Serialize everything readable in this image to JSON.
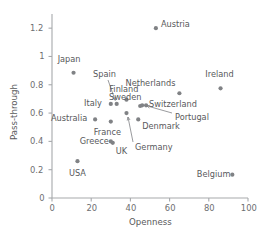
{
  "chart_data": {
    "type": "scatter",
    "title": "",
    "xlabel": "Openness",
    "ylabel": "Pass-through",
    "xlim": [
      0,
      100
    ],
    "ylim": [
      0,
      1.3
    ],
    "grid": false,
    "legend": "none",
    "xticks": [
      "0",
      "20",
      "40",
      "60",
      "80",
      "100"
    ],
    "xtick_values": [
      0,
      20,
      40,
      60,
      80,
      100
    ],
    "yticks": [
      "0",
      "0.2",
      "0.4",
      "0.6",
      "0.8",
      "1",
      "1.2"
    ],
    "ytick_values": [
      0,
      0.2,
      0.4,
      0.6,
      0.8,
      1.0,
      1.2
    ],
    "point_color": "#808285",
    "axis_color": "#a7a9ac",
    "points": [
      {
        "label": "Austria",
        "x": 53,
        "y": 1.2
      },
      {
        "label": "Japan",
        "x": 11,
        "y": 0.885
      },
      {
        "label": "Ireland",
        "x": 86,
        "y": 0.775
      },
      {
        "label": "Netherlands",
        "x": 65,
        "y": 0.74
      },
      {
        "label": "Finland",
        "x": 38,
        "y": 0.695
      },
      {
        "label": "Spain",
        "x": 33,
        "y": 0.665
      },
      {
        "label": "Italy",
        "x": 30,
        "y": 0.665
      },
      {
        "label": "Sweden",
        "x": 45,
        "y": 0.65
      },
      {
        "label": "Switzerland",
        "x": 48,
        "y": 0.655
      },
      {
        "label": "Portugal",
        "x": 46,
        "y": 0.655
      },
      {
        "label": "Germany",
        "x": 38,
        "y": 0.6
      },
      {
        "label": "Denmark",
        "x": 44,
        "y": 0.555
      },
      {
        "label": "Australia",
        "x": 22,
        "y": 0.555
      },
      {
        "label": "France",
        "x": 30,
        "y": 0.54
      },
      {
        "label": "Greece",
        "x": 30,
        "y": 0.4
      },
      {
        "label": "UK",
        "x": 31,
        "y": 0.39
      },
      {
        "label": "USA",
        "x": 13,
        "y": 0.26
      },
      {
        "label": "Belgium",
        "x": 92,
        "y": 0.165
      }
    ],
    "annotations": [
      {
        "label": "Spain",
        "style": "leader-arrow",
        "note": "label above-left with arrow pointing down-right to Spain point"
      },
      {
        "label": "Portugal",
        "style": "leader-arrow",
        "note": "label right with long horizontal arrow pointing left to Portugal point"
      },
      {
        "label": "Germany",
        "style": "leader-arrow",
        "note": "label below-right with arrow pointing up-left to Germany point"
      }
    ]
  },
  "caption": {
    "text": ""
  }
}
